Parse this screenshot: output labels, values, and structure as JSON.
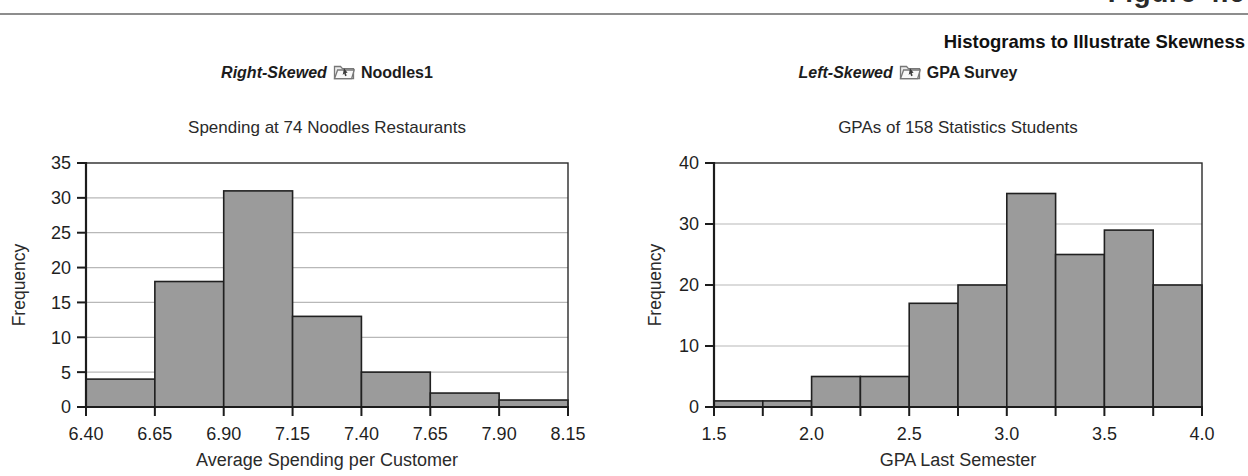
{
  "figure": {
    "label": "Figure 4.6",
    "header": "Histograms to Illustrate Skewness"
  },
  "chart_data": [
    {
      "type": "bar",
      "panel": {
        "skew_label": "Right-Skewed",
        "dataset_label": "Noodles1",
        "dataset_icon": "folder-data-icon"
      },
      "title": "Spending at 74 Noodles Restaurants",
      "xlabel": "Average Spending per Customer",
      "ylabel": "Frequency",
      "bin_edges": [
        6.4,
        6.65,
        6.9,
        7.15,
        7.4,
        7.65,
        7.9,
        8.15
      ],
      "values": [
        4,
        18,
        31,
        13,
        5,
        2,
        1
      ],
      "ylim": [
        0,
        35
      ],
      "yticks": [
        0,
        5,
        10,
        15,
        20,
        25,
        30,
        35
      ],
      "xticks": [
        {
          "value": 6.4,
          "label": "6.40"
        },
        {
          "value": 6.65,
          "label": "6.65"
        },
        {
          "value": 6.9,
          "label": "6.90"
        },
        {
          "value": 7.15,
          "label": "7.15"
        },
        {
          "value": 7.4,
          "label": "7.40"
        },
        {
          "value": 7.65,
          "label": "7.65"
        },
        {
          "value": 7.9,
          "label": "7.90"
        },
        {
          "value": 8.15,
          "label": "8.15"
        }
      ],
      "grid": "horizontal",
      "legend": "none",
      "bar_fill": "#9b9b9b",
      "bar_stroke": "#202020",
      "grid_color": "#b8b8b8",
      "frame_color": "#2a2a2a"
    },
    {
      "type": "bar",
      "panel": {
        "skew_label": "Left-Skewed",
        "dataset_label": "GPA Survey",
        "dataset_icon": "folder-data-icon"
      },
      "title": "GPAs of 158 Statistics Students",
      "xlabel": "GPA Last Semester",
      "ylabel": "Frequency",
      "bin_edges": [
        1.5,
        1.75,
        2.0,
        2.25,
        2.5,
        2.75,
        3.0,
        3.25,
        3.5,
        3.75,
        4.0
      ],
      "values": [
        1,
        1,
        5,
        5,
        17,
        20,
        35,
        25,
        29,
        20
      ],
      "ylim": [
        0,
        40
      ],
      "yticks": [
        0,
        10,
        20,
        30,
        40
      ],
      "xticks": [
        {
          "value": 1.5,
          "label": "1.5"
        },
        {
          "value": 2.0,
          "label": "2.0"
        },
        {
          "value": 2.5,
          "label": "2.5"
        },
        {
          "value": 3.0,
          "label": "3.0"
        },
        {
          "value": 3.5,
          "label": "3.5"
        },
        {
          "value": 4.0,
          "label": "4.0"
        }
      ],
      "grid": "horizontal",
      "legend": "none",
      "bar_fill": "#9b9b9b",
      "bar_stroke": "#202020",
      "grid_color": "#b8b8b8",
      "frame_color": "#2a2a2a"
    }
  ]
}
